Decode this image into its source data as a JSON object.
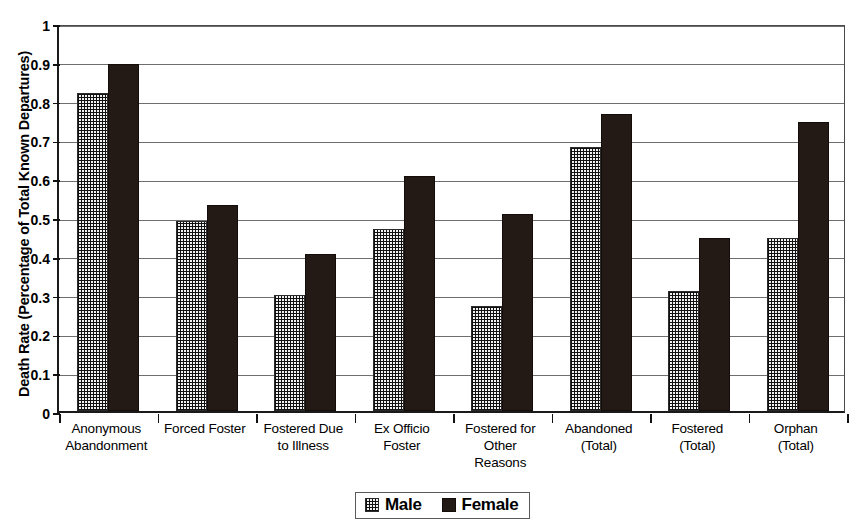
{
  "chart_data": {
    "type": "bar",
    "title": "",
    "xlabel": "",
    "ylabel": "Death Rate (Percentage of Total Known Departures)",
    "ylim": [
      0,
      1
    ],
    "ytick_labels": [
      "0",
      "0.1",
      "0.2",
      "0.3",
      "0.4",
      "0.5",
      "0.6",
      "0.7",
      "0.8",
      "0.9",
      "1"
    ],
    "ytick_values": [
      0,
      0.1,
      0.2,
      0.3,
      0.4,
      0.5,
      0.6,
      0.7,
      0.8,
      0.9,
      1
    ],
    "grid": true,
    "legend_position": "bottom",
    "categories": [
      "Anonymous Abandonment",
      "Forced Foster",
      "Fostered Due to Illness",
      "Ex Officio Foster",
      "Fostered for Other Reasons",
      "Abandoned (Total)",
      "Fostered (Total)",
      "Orphan (Total)"
    ],
    "category_lines": [
      [
        "Anonymous",
        "Abandonment"
      ],
      [
        "Forced Foster"
      ],
      [
        "Fostered Due",
        "to Illness"
      ],
      [
        "Ex Officio",
        "Foster"
      ],
      [
        "Fostered for",
        "Other",
        "Reasons"
      ],
      [
        "Abandoned",
        "(Total)"
      ],
      [
        "Fostered",
        "(Total)"
      ],
      [
        "Orphan",
        "(Total)"
      ]
    ],
    "series": [
      {
        "name": "Male",
        "color": "#f2f2f2",
        "pattern": "dotted-grid",
        "values": [
          0.82,
          0.49,
          0.3,
          0.47,
          0.27,
          0.68,
          0.31,
          0.445
        ]
      },
      {
        "name": "Female",
        "color": "#231a16",
        "pattern": "solid",
        "values": [
          0.895,
          0.53,
          0.405,
          0.605,
          0.508,
          0.765,
          0.447,
          0.745
        ]
      }
    ]
  },
  "legend": {
    "items": [
      {
        "label": "Male",
        "swatch": "male-swatch"
      },
      {
        "label": "Female",
        "swatch": "female-swatch"
      }
    ]
  }
}
